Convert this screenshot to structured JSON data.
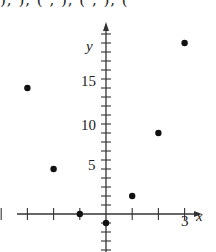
{
  "header": {
    "cropped_text": "), ), (  ,  ), (  , ), ("
  },
  "chart_data": {
    "type": "scatter",
    "title": "",
    "xlabel": "x",
    "ylabel": "y",
    "x_ticks": [
      -4,
      -3,
      -2,
      -1,
      0,
      1,
      2,
      3
    ],
    "x_tick_labels": [
      {
        "value": 3,
        "label": "3"
      }
    ],
    "y_tick_labels": [
      {
        "value": 5,
        "label": "5"
      },
      {
        "value": 10,
        "label": "10"
      },
      {
        "value": 15,
        "label": "15"
      }
    ],
    "y_minor_tick_step": 1,
    "xlim": [
      -4,
      3.5
    ],
    "ylim": [
      -4,
      21
    ],
    "grid": false,
    "legend": null,
    "points": [
      {
        "x": -3,
        "y": 14
      },
      {
        "x": -2,
        "y": 5
      },
      {
        "x": -1,
        "y": 0
      },
      {
        "x": 0,
        "y": -1
      },
      {
        "x": 1,
        "y": 2
      },
      {
        "x": 2,
        "y": 9
      },
      {
        "x": 3,
        "y": 19
      }
    ]
  },
  "labels": {
    "x_axis": "x",
    "y_axis": "y",
    "x3": "3",
    "y5": "5",
    "y10": "10",
    "y15": "15"
  }
}
